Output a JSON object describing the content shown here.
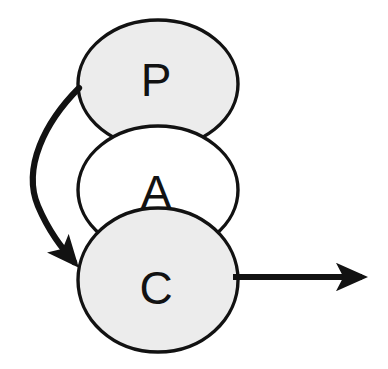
{
  "diagram": {
    "type": "node-link-diagram",
    "background_color": "#ffffff",
    "stroke_color": "#121212",
    "nodes": [
      {
        "id": "presentation",
        "label": "P",
        "shape": "ellipse",
        "fill_color": "#ececec",
        "stroke_color": "#121212",
        "cx": 158,
        "cy": 84,
        "rx": 80,
        "ry": 64
      },
      {
        "id": "abstraction",
        "label": "A",
        "shape": "ellipse",
        "fill_color": "#ffffff",
        "stroke_color": "#121212",
        "cx": 158,
        "cy": 190,
        "rx": 80,
        "ry": 64
      },
      {
        "id": "control",
        "label": "C",
        "shape": "ellipse",
        "fill_color": "#ececec",
        "stroke_color": "#121212",
        "cx": 158,
        "cy": 280,
        "rx": 80,
        "ry": 72
      }
    ],
    "edges": [
      {
        "id": "p-to-c-curve",
        "kind": "curved-arrow",
        "from": "presentation",
        "to": "control",
        "label": "",
        "stroke_color": "#121212",
        "stroke_width": 6,
        "arrowhead": "filled-triangle"
      },
      {
        "id": "c-to-outside",
        "kind": "straight-arrow",
        "from": "control",
        "to": "",
        "label": "",
        "stroke_color": "#121212",
        "stroke_width": 6,
        "arrowhead": "filled-triangle",
        "x1": 233,
        "y1": 277,
        "x2": 376,
        "y2": 277
      }
    ]
  }
}
